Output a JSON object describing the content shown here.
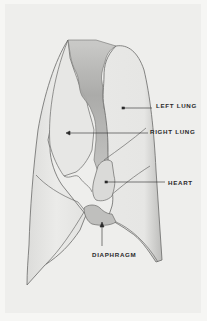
{
  "diagram": {
    "colors": {
      "background": "#eeeeec",
      "border": "#f6f6f4",
      "organ_fill": "#e4e4e2",
      "shading": "#b5b5b3",
      "mediastinum": "#a9a9a7",
      "outline": "#6a6a68",
      "label_text": "#2a2a2a"
    },
    "labels": [
      {
        "id": "left-lung",
        "text": "LEFT LUNG",
        "x": 156,
        "y": 105,
        "pointer_to": [
          124,
          108
        ]
      },
      {
        "id": "right-lung",
        "text": "RIGHT LUNG",
        "x": 150,
        "y": 131,
        "pointer_to": [
          67,
          133
        ]
      },
      {
        "id": "heart",
        "text": "HEART",
        "x": 168,
        "y": 179,
        "pointer_to": [
          107,
          182
        ]
      },
      {
        "id": "diaphragm",
        "text": "DIAPHRAGM",
        "x": 92,
        "y": 253,
        "pointer_to": [
          102,
          222
        ]
      }
    ]
  }
}
